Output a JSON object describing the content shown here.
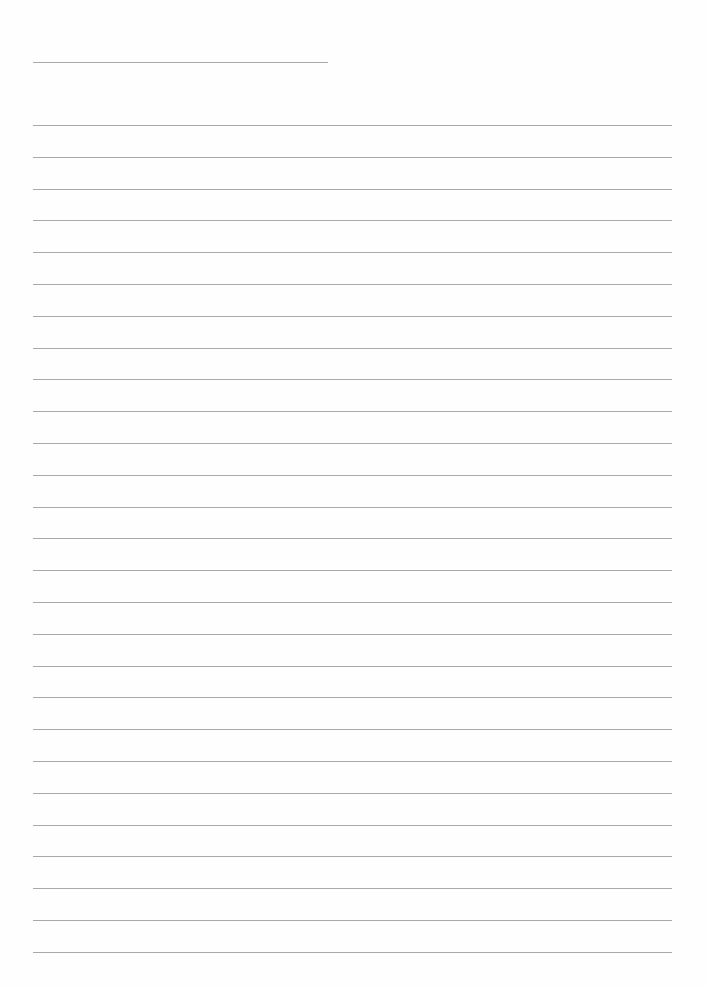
{
  "page": {
    "type": "lined-paper",
    "title_line": {
      "text": ""
    },
    "lines": [
      {
        "text": ""
      },
      {
        "text": ""
      },
      {
        "text": ""
      },
      {
        "text": ""
      },
      {
        "text": ""
      },
      {
        "text": ""
      },
      {
        "text": ""
      },
      {
        "text": ""
      },
      {
        "text": ""
      },
      {
        "text": ""
      },
      {
        "text": ""
      },
      {
        "text": ""
      },
      {
        "text": ""
      },
      {
        "text": ""
      },
      {
        "text": ""
      },
      {
        "text": ""
      },
      {
        "text": ""
      },
      {
        "text": ""
      },
      {
        "text": ""
      },
      {
        "text": ""
      },
      {
        "text": ""
      },
      {
        "text": ""
      },
      {
        "text": ""
      },
      {
        "text": ""
      },
      {
        "text": ""
      },
      {
        "text": ""
      },
      {
        "text": ""
      }
    ],
    "rule_color": "#9a9a9a",
    "background_color": "#fefefe"
  }
}
